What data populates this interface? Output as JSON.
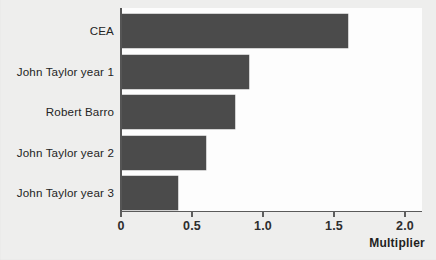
{
  "chart_data": {
    "type": "bar",
    "orientation": "horizontal",
    "title": "",
    "subtitle": "",
    "xlabel": "Multiplier",
    "ylabel": "",
    "categories": [
      "CEA",
      "John Taylor year 1",
      "Robert Barro",
      "John Taylor year 2",
      "John Taylor year 3"
    ],
    "values": [
      1.6,
      0.9,
      0.8,
      0.6,
      0.4
    ],
    "xlim": [
      0,
      2.15
    ],
    "xticks": [
      0,
      0.5,
      1.0,
      1.5,
      2.0
    ],
    "xtick_labels": [
      "0",
      "0.5",
      "1.0",
      "1.5",
      "2.0"
    ],
    "grid": false,
    "legend": false,
    "bar_color": "#4b4b4b",
    "axis_color": "#5a5a5a",
    "panel_background": "#fdfdfd",
    "figure_background": "#eeeeed"
  },
  "axis": {
    "x_title": "Multiplier",
    "ticks": [
      {
        "label": "0",
        "value": 0
      },
      {
        "label": "0.5",
        "value": 0.5
      },
      {
        "label": "1.0",
        "value": 1.0
      },
      {
        "label": "1.5",
        "value": 1.5
      },
      {
        "label": "2.0",
        "value": 2.0
      }
    ]
  },
  "bars": [
    {
      "label": "CEA",
      "value": 1.6
    },
    {
      "label": "John Taylor year 1",
      "value": 0.9
    },
    {
      "label": "Robert Barro",
      "value": 0.8
    },
    {
      "label": "John Taylor year 2",
      "value": 0.6
    },
    {
      "label": "John Taylor year 3",
      "value": 0.4
    }
  ],
  "page_bleed": {
    "text": ""
  }
}
